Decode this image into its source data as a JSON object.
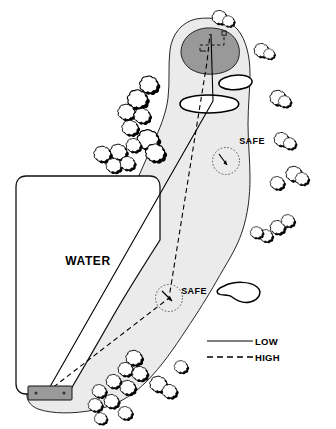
{
  "diagram": {
    "kind": "golf-hole-strategy-map",
    "colors": {
      "page_background": "#ffffff",
      "fairway_fill": "#ebebeb",
      "green_fill": "#999999",
      "tee_box_fill": "#9a9a9a",
      "bunker_fill": "#ffffff",
      "water_fill": "#ffffff",
      "outline": "#000000",
      "tree_fill": "#ffffff",
      "tree_shadow": "#000000"
    },
    "labels": {
      "water": "WATER",
      "safe_upper": "SAFE",
      "safe_lower": "SAFE"
    },
    "legend": {
      "items": [
        {
          "label": "LOW",
          "line_style": "solid",
          "icon": "solid-line-icon"
        },
        {
          "label": "HIGH",
          "line_style": "dashed",
          "icon": "dashed-line-icon"
        }
      ]
    },
    "features": [
      {
        "name": "green",
        "type": "putting-green"
      },
      {
        "name": "pin-zone",
        "type": "dashed-pin-placement-rectangle"
      },
      {
        "name": "greenside-bunker",
        "type": "bunker"
      },
      {
        "name": "cross-bunker",
        "type": "bunker"
      },
      {
        "name": "right-fairway-bunker",
        "type": "bunker"
      },
      {
        "name": "water-hazard",
        "type": "water"
      },
      {
        "name": "tee-box",
        "type": "tee"
      },
      {
        "name": "fairway",
        "type": "fairway"
      }
    ],
    "landing_zones": [
      {
        "name": "safe-landing-zone-upper",
        "label": "SAFE"
      },
      {
        "name": "safe-landing-zone-lower",
        "label": "SAFE"
      }
    ],
    "shot_lines": [
      {
        "name": "low-shot-line",
        "style": "solid",
        "legend": "LOW"
      },
      {
        "name": "high-shot-line",
        "style": "dashed",
        "legend": "HIGH"
      }
    ]
  }
}
